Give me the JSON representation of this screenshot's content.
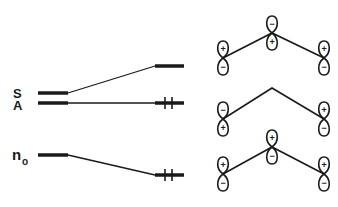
{
  "diagram": {
    "type": "molecular-orbital-correlation-diagram",
    "levels_left": [
      {
        "id": "S",
        "label": "S",
        "y": 93
      },
      {
        "id": "A",
        "label": "A",
        "y": 103
      },
      {
        "id": "n0",
        "label": "n",
        "subscript": "o",
        "y": 155
      }
    ],
    "levels_right": [
      {
        "id": "S",
        "y": 66,
        "electrons": 0
      },
      {
        "id": "A",
        "y": 103,
        "electrons": 2
      },
      {
        "id": "n0",
        "y": 175,
        "electrons": 2
      }
    ],
    "orbital_rows": [
      {
        "row": "top",
        "level": "S",
        "signs": {
          "left_top": "+",
          "left_bottom": "−",
          "center_top": "−",
          "center_bottom": "+",
          "right_top": "+",
          "right_bottom": "−"
        }
      },
      {
        "row": "middle",
        "level": "A",
        "signs": {
          "left_top": "−",
          "left_bottom": "+",
          "right_top": "+",
          "right_bottom": "−"
        }
      },
      {
        "row": "bottom",
        "level": "n0",
        "signs": {
          "left_top": "+",
          "left_bottom": "−",
          "center_top": "+",
          "center_bottom": "−",
          "right_top": "+",
          "right_bottom": "−"
        }
      }
    ]
  }
}
